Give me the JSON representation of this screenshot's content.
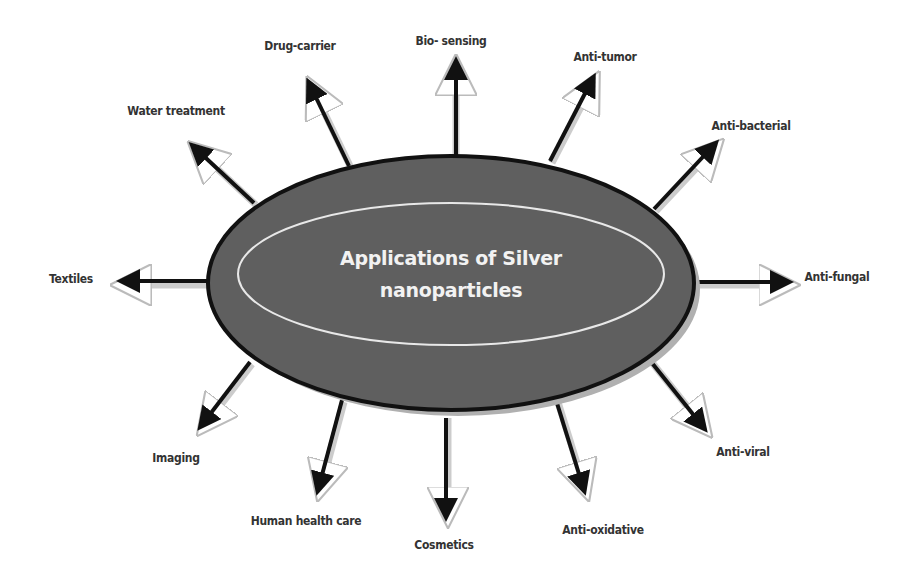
{
  "diagram": {
    "center": {
      "line1": "Applications of Silver",
      "line2": "nanoparticles",
      "fill_color": "#5f5f5f",
      "border_color": "#111111",
      "inner_ring_color": "#e8e8e8"
    },
    "applications": [
      {
        "label": "Water treatment",
        "x": 176,
        "y": 111
      },
      {
        "label": "Drug-carrier",
        "x": 300,
        "y": 46
      },
      {
        "label": "Bio- sensing",
        "x": 451,
        "y": 41
      },
      {
        "label": "Anti-tumor",
        "x": 605,
        "y": 57
      },
      {
        "label": "Anti-bacterial",
        "x": 751,
        "y": 126
      },
      {
        "label": "Anti-fungal",
        "x": 837,
        "y": 277
      },
      {
        "label": "Anti-viral",
        "x": 743,
        "y": 452
      },
      {
        "label": "Anti-oxidative",
        "x": 603,
        "y": 530
      },
      {
        "label": "Cosmetics",
        "x": 444,
        "y": 545
      },
      {
        "label": "Human health care",
        "x": 306,
        "y": 521
      },
      {
        "label": "Imaging",
        "x": 176,
        "y": 458
      },
      {
        "label": "Textiles",
        "x": 71,
        "y": 279
      }
    ]
  }
}
